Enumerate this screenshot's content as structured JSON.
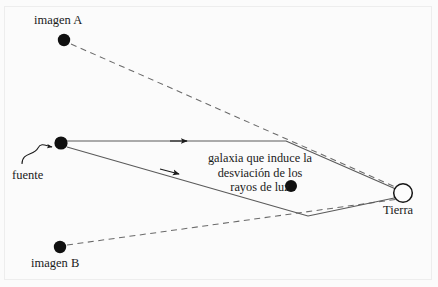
{
  "figure": {
    "background_color": "#fbfbfb",
    "ink_color": "#1a1a1a",
    "line_color": "#555555",
    "frame_color": "#ededed"
  },
  "labels": {
    "imagen_a": "imagen A",
    "imagen_b": "imagen B",
    "fuente": "fuente",
    "tierra": "Tierra",
    "galaxy_line1": "galaxia que induce la",
    "galaxy_line2": "desviación de los",
    "galaxy_line3": "rayos de luz"
  },
  "nodes": [
    {
      "name": "imagen-a-dot",
      "x": 64,
      "y": 40,
      "r": 6,
      "style": "filled"
    },
    {
      "name": "fuente-dot",
      "x": 61,
      "y": 143,
      "r": 6.5,
      "style": "filled"
    },
    {
      "name": "imagen-b-dot",
      "x": 60,
      "y": 247,
      "r": 6,
      "style": "filled"
    },
    {
      "name": "galaxia-dot",
      "x": 291,
      "y": 186,
      "r": 6,
      "style": "filled"
    },
    {
      "name": "tierra-circle",
      "x": 403,
      "y": 193,
      "r": 9.5,
      "style": "open"
    }
  ],
  "edges": [
    {
      "name": "ray-upper",
      "from": "fuente",
      "to": "tierra",
      "style": "solid",
      "arrowhead": true,
      "arrow_x": 185,
      "arrow_y": 137
    },
    {
      "name": "ray-lower",
      "from": "fuente",
      "to": "tierra",
      "style": "solid",
      "arrowhead": true,
      "arrow_x": 176,
      "arrow_y": 172
    },
    {
      "name": "sightline-imagen-a",
      "from": "imagen-a",
      "to": "tierra",
      "style": "dashed",
      "arrowhead": false
    },
    {
      "name": "sightline-imagen-b",
      "from": "imagen-b",
      "to": "tierra",
      "style": "dashed",
      "arrowhead": false
    },
    {
      "name": "fuente-pointer",
      "from": "fuente-label",
      "to": "fuente-dot",
      "style": "curved-arrow",
      "arrowhead": true
    }
  ]
}
